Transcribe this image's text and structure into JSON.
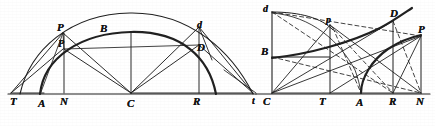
{
  "figure": {
    "background_color": "#ffffff",
    "ink_color": "#1a1a1a",
    "width": 435,
    "height": 126,
    "style": "engraved line drawing, italic serif point labels"
  },
  "left_figure": {
    "name": "arc-construction",
    "description": "Two concentric arcs rising from a horizontal baseline with chords and radii drawn to center C",
    "baseline": {
      "label_sequence": [
        "T",
        "A",
        "N",
        "C",
        "R",
        "t"
      ]
    },
    "labels": [
      {
        "id": "T",
        "text": "T",
        "x": 10,
        "y": 100,
        "case": "cap",
        "note": "left end of baseline"
      },
      {
        "id": "A",
        "text": "A",
        "x": 38,
        "y": 102,
        "case": "cap",
        "note": "foot of inner arc on baseline"
      },
      {
        "id": "N",
        "text": "N",
        "x": 60,
        "y": 100,
        "case": "cap",
        "note": "ordinate foot under P"
      },
      {
        "id": "C",
        "text": "C",
        "x": 129,
        "y": 102,
        "case": "cap",
        "note": "center of the arcs"
      },
      {
        "id": "R",
        "text": "R",
        "x": 194,
        "y": 100,
        "case": "cap",
        "note": "ordinate foot under D"
      },
      {
        "id": "P1",
        "text": "P",
        "x": 58,
        "y": 25,
        "case": "cap",
        "note": "point on outer arc"
      },
      {
        "id": "P2",
        "text": "P",
        "x": 59,
        "y": 42,
        "case": "small",
        "note": "point on inner arc"
      },
      {
        "id": "B",
        "text": "B",
        "x": 101,
        "y": 27,
        "case": "cap",
        "note": "apex of inner arc"
      },
      {
        "id": "d",
        "text": "d",
        "x": 196,
        "y": 24,
        "case": "lower",
        "note": "point on outer arc, right side"
      },
      {
        "id": "D",
        "text": "D",
        "x": 196,
        "y": 46,
        "case": "cap",
        "note": "point on inner arc, right side"
      }
    ]
  },
  "right_figure": {
    "name": "curve-construction",
    "description": "Rectangular frame on a baseline with two rising curves, chords and dashed construction lines",
    "baseline": {
      "label_sequence": [
        "t",
        "C",
        "T",
        "A",
        "R",
        "N"
      ]
    },
    "labels": [
      {
        "id": "t",
        "text": "t",
        "x": 254,
        "y": 101,
        "case": "lower",
        "note": "left end of right baseline"
      },
      {
        "id": "C",
        "text": "C",
        "x": 265,
        "y": 101,
        "case": "cap",
        "note": "origin of right figure"
      },
      {
        "id": "T",
        "text": "T",
        "x": 320,
        "y": 101,
        "case": "cap",
        "note": "abscissa of p"
      },
      {
        "id": "A",
        "text": "A",
        "x": 358,
        "y": 102,
        "case": "cap",
        "note": "foot of lower curve"
      },
      {
        "id": "R",
        "text": "R",
        "x": 391,
        "y": 101,
        "case": "cap",
        "note": "abscissa of D"
      },
      {
        "id": "N",
        "text": "N",
        "x": 417,
        "y": 101,
        "case": "cap",
        "note": "abscissa of P"
      },
      {
        "id": "d",
        "text": "d",
        "x": 264,
        "y": 8,
        "case": "lower",
        "note": "top-left of frame"
      },
      {
        "id": "B",
        "text": "B",
        "x": 263,
        "y": 50,
        "case": "cap",
        "note": "left end of rising curve"
      },
      {
        "id": "p",
        "text": "p",
        "x": 327,
        "y": 19,
        "case": "lower",
        "note": "point on upper arc"
      },
      {
        "id": "D",
        "text": "D",
        "x": 392,
        "y": 12,
        "case": "cap",
        "note": "point on rising curve"
      },
      {
        "id": "P",
        "text": "P",
        "x": 419,
        "y": 28,
        "case": "cap",
        "note": "point on lower rising curve"
      }
    ]
  },
  "colors": {
    "ink": "#1a1a1a",
    "thin_ink": "#2b2b2b",
    "paper": "#ffffff"
  }
}
